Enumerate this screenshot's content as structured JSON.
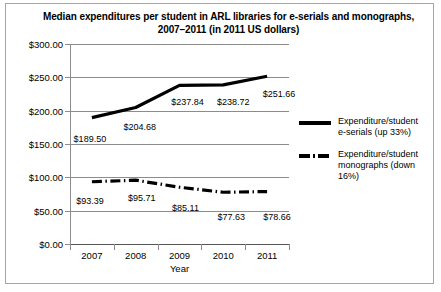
{
  "chart_data": {
    "type": "line",
    "title": "Median expenditures per student in ARL libraries for e-serials and monographs,",
    "title_line2": "2007–2011 (in 2011 US dollars)",
    "xlabel": "Year",
    "ylabel": "",
    "categories": [
      "2007",
      "2008",
      "2009",
      "2010",
      "2011"
    ],
    "ylim": [
      0,
      300
    ],
    "yticks": [
      "$0.00",
      "$50.00",
      "$100.00",
      "$150.00",
      "$200.00",
      "$250.00",
      "$300.00"
    ],
    "ytick_values": [
      0,
      50,
      100,
      150,
      200,
      250,
      300
    ],
    "grid": "horizontal",
    "legend_position": "right",
    "series": [
      {
        "name": "Expenditure/student e-serials (up 33%)",
        "legend_line1": "Expenditure/student",
        "legend_line2": "e-serials (up 33%)",
        "style": "solid",
        "color": "#000000",
        "values": [
          189.5,
          204.68,
          237.84,
          238.72,
          251.66
        ],
        "labels": [
          "$189.50",
          "$204.68",
          "$237.84",
          "$238.72",
          "$251.66"
        ]
      },
      {
        "name": "Expenditure/student monographs (down 16%)",
        "legend_line1": "Expenditure/student",
        "legend_line2": "monographs (down 16%)",
        "style": "dash-dot",
        "color": "#000000",
        "values": [
          93.39,
          95.71,
          85.11,
          77.63,
          78.66
        ],
        "labels": [
          "$93.39",
          "$95.71",
          "$85.11",
          "$77.63",
          "$78.66"
        ]
      }
    ]
  }
}
